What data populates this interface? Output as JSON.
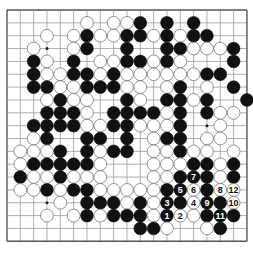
{
  "board": {
    "size": 19,
    "origin_x": 7,
    "origin_y": 10,
    "step_x": 13.33,
    "step_y": 12.85,
    "stone_radius": 6.4,
    "colors": {
      "background": "#ffffff",
      "line": "#9a9a9a",
      "border": "#555555",
      "black": "#111111",
      "white": "#ffffff",
      "white_edge": "#777777"
    },
    "star_points": [
      [
        3,
        3
      ],
      [
        3,
        9
      ],
      [
        3,
        15
      ],
      [
        9,
        3
      ],
      [
        9,
        9
      ],
      [
        9,
        15
      ],
      [
        15,
        3
      ],
      [
        15,
        9
      ],
      [
        15,
        15
      ]
    ],
    "rows": [
      "...................",
      "......W.WWB.B.B....",
      "...W.WBWWBBWBWBB...",
      "..W..WB..B..BBWWWB.",
      "..BW.B.WWBBWBW...B.",
      "..BWWBBWBWWWWWWBB..",
      "..BBWWBBBWW.WB.W.B.",
      "...WBWW..BW.BBWB..B",
      "...BBBW.BBBBWB.BWW.",
      "..BBBBWWBBWWWB..W..",
      "..WB..BB.B.WBB.WW..",
      ".WWWB.BWBB.WWBWW.W.",
      ".WBBBBBW...WWWBBWB.",
      ".BWWBWWW...WWBBBWB.",
      ".WWBWBBWWWWWBBWBWW.",
      "....W.BBBWBWBBWBBW.",
      "...W.WBWBBBWBWWBBB.",
      "..........BBW..WB..",
      "..................."
    ],
    "labels": [
      {
        "row": 16,
        "col": 12,
        "text": "1",
        "color": "B"
      },
      {
        "row": 16,
        "col": 13,
        "text": "2",
        "color": "W"
      },
      {
        "row": 15,
        "col": 12,
        "text": "3",
        "color": "B"
      },
      {
        "row": 15,
        "col": 14,
        "text": "4",
        "color": "W"
      },
      {
        "row": 14,
        "col": 13,
        "text": "5",
        "color": "B"
      },
      {
        "row": 14,
        "col": 14,
        "text": "6",
        "color": "W"
      },
      {
        "row": 13,
        "col": 14,
        "text": "7",
        "color": "B"
      },
      {
        "row": 14,
        "col": 16,
        "text": "8",
        "color": "W"
      },
      {
        "row": 15,
        "col": 15,
        "text": "9",
        "color": "B"
      },
      {
        "row": 15,
        "col": 17,
        "text": "10",
        "color": "W"
      },
      {
        "row": 16,
        "col": 16,
        "text": "11",
        "color": "B"
      },
      {
        "row": 14,
        "col": 17,
        "text": "12",
        "color": "W"
      }
    ]
  }
}
